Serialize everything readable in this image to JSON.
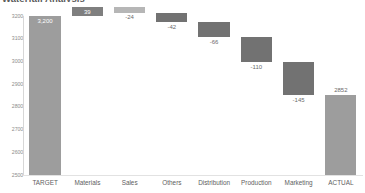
{
  "chart_data": {
    "type": "bar",
    "subtype": "waterfall",
    "title": "Waterfall Analysis",
    "xlabel": "",
    "ylabel": "",
    "ylim": [
      2500,
      3200
    ],
    "yticks": [
      3200,
      3100,
      3000,
      2900,
      2800,
      2700,
      2600,
      2500
    ],
    "ytick_labels": [
      "3200",
      "3100",
      "3000",
      "2900",
      "2800",
      "2700",
      "2600",
      "2500"
    ],
    "grid": false,
    "legend": "none",
    "categories": [
      "TARGET",
      "Materials",
      "Sales",
      "Others",
      "Distribution",
      "Production",
      "Marketing",
      "ACTUAL"
    ],
    "values": [
      3200,
      39,
      -24,
      -42,
      -66,
      -110,
      -145,
      2852
    ],
    "data_labels": [
      "3,200",
      "39",
      "-24",
      "-42",
      "-66",
      "-110",
      "-145",
      "2852"
    ],
    "bars": [
      {
        "category": "TARGET",
        "label": "3,200",
        "kind": "total",
        "base": 2500,
        "top": 3200,
        "color": "#9d9d9d",
        "label_position": "inside"
      },
      {
        "category": "Materials",
        "label": "39",
        "kind": "increase",
        "base": 3200,
        "top": 3239,
        "color": "#7f7f7f",
        "label_position": "inside"
      },
      {
        "category": "Sales",
        "label": "-24",
        "kind": "decrease",
        "base": 3215,
        "top": 3239,
        "color": "#b6b6b6",
        "label_position": "below"
      },
      {
        "category": "Others",
        "label": "-42",
        "kind": "decrease",
        "base": 3173,
        "top": 3215,
        "color": "#727272",
        "label_position": "below"
      },
      {
        "category": "Distribution",
        "label": "-66",
        "kind": "decrease",
        "base": 3107,
        "top": 3173,
        "color": "#727272",
        "label_position": "below"
      },
      {
        "category": "Production",
        "label": "-110",
        "kind": "decrease",
        "base": 2997,
        "top": 3107,
        "color": "#727272",
        "label_position": "below"
      },
      {
        "category": "Marketing",
        "label": "-145",
        "kind": "decrease",
        "base": 2852,
        "top": 2997,
        "color": "#727272",
        "label_position": "below"
      },
      {
        "category": "ACTUAL",
        "label": "2852",
        "kind": "total",
        "base": 2500,
        "top": 2852,
        "color": "#9d9d9d",
        "label_position": "above"
      }
    ],
    "colors": {
      "total_bar": "#9d9d9d",
      "increase_bar": "#7f7f7f",
      "decrease_bar": "#727272",
      "sales_bar": "#b6b6b6",
      "axis_text": "#8c8c8c",
      "label_text": "#6b6b6b",
      "inside_label_text": "#ffffff",
      "background": "#ffffff"
    }
  }
}
